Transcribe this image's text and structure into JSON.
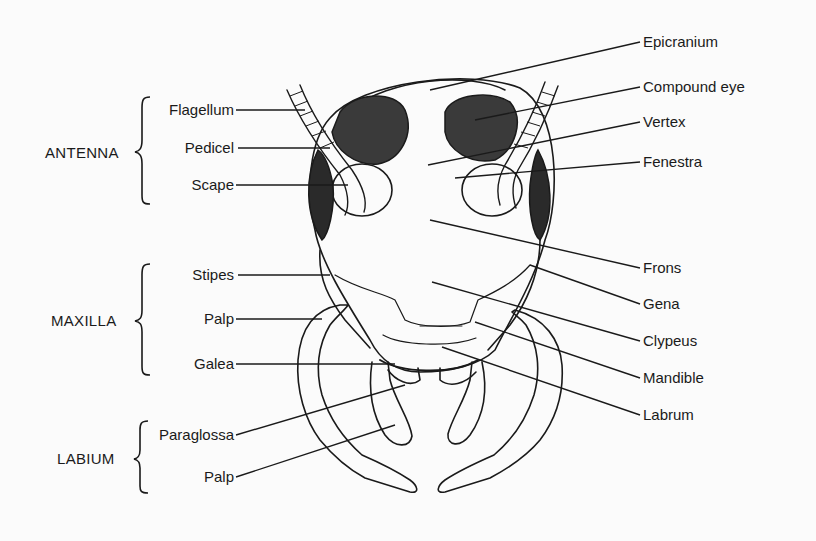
{
  "diagram": {
    "groups": {
      "antenna": {
        "label": "ANTENNA",
        "parts": [
          "Flagellum",
          "Pedicel",
          "Scape"
        ]
      },
      "maxilla": {
        "label": "MAXILLA",
        "parts": [
          "Stipes",
          "Palp",
          "Galea"
        ]
      },
      "labium": {
        "label": "LABIUM",
        "parts": [
          "Paraglossa",
          "Palp"
        ]
      }
    },
    "right_labels": [
      "Epicranium",
      "Compound eye",
      "Vertex",
      "Fenestra",
      "Frons",
      "Gena",
      "Clypeus",
      "Mandible",
      "Labrum"
    ],
    "colors": {
      "ink": "#1a1a1a",
      "background": "#fbfbfb",
      "eye_fill": "#2a2a2a"
    }
  }
}
